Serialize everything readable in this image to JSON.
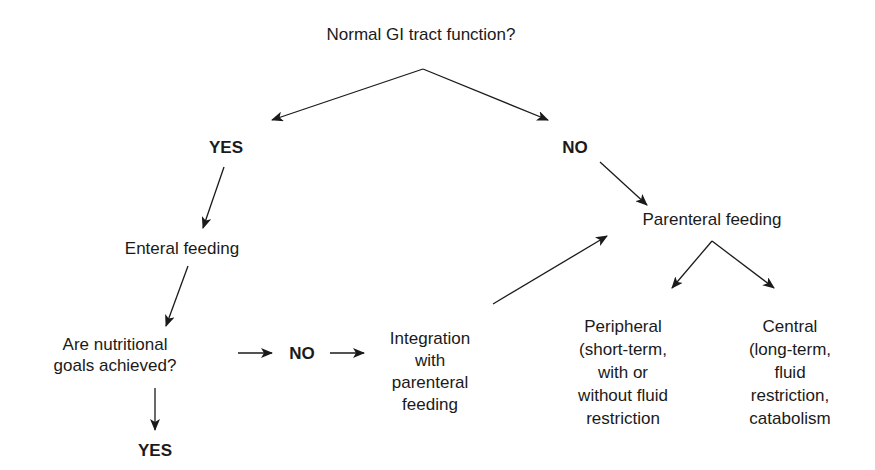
{
  "diagram": {
    "type": "flowchart",
    "nodes": {
      "root": {
        "text": "Normal GI tract function?"
      },
      "yes_top": {
        "text": "YES"
      },
      "no_top": {
        "text": "NO"
      },
      "enteral": {
        "text": "Enteral feeding"
      },
      "goals": {
        "line1": "Are nutritional",
        "line2": "goals achieved?"
      },
      "no_mid": {
        "text": "NO"
      },
      "yes_bottom": {
        "text": "YES"
      },
      "integration": {
        "line1": "Integration",
        "line2": "with",
        "line3": "parenteral",
        "line4": "feeding"
      },
      "parenteral": {
        "text": "Parenteral feeding"
      },
      "peripheral": {
        "line1": "Peripheral",
        "line2": "(short-term,",
        "line3": "with or",
        "line4": "without fluid",
        "line5": "restriction"
      },
      "central": {
        "line1": "Central",
        "line2": "(long-term,",
        "line3": "fluid",
        "line4": "restriction,",
        "line5": "catabolism"
      }
    },
    "edges": [
      {
        "from": "root",
        "to": "yes_top"
      },
      {
        "from": "root",
        "to": "no_top"
      },
      {
        "from": "yes_top",
        "to": "enteral"
      },
      {
        "from": "enteral",
        "to": "goals"
      },
      {
        "from": "goals",
        "to": "no_mid"
      },
      {
        "from": "no_mid",
        "to": "integration"
      },
      {
        "from": "goals",
        "to": "yes_bottom"
      },
      {
        "from": "integration",
        "to": "parenteral"
      },
      {
        "from": "no_top",
        "to": "parenteral"
      },
      {
        "from": "parenteral",
        "to": "peripheral"
      },
      {
        "from": "parenteral",
        "to": "central"
      }
    ],
    "colors": {
      "ink": "#1a1a1a",
      "background": "#ffffff"
    }
  }
}
